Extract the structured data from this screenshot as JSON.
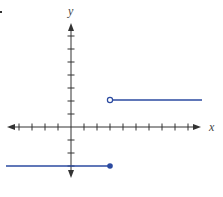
{
  "chart_data": {
    "type": "line",
    "title": "",
    "xlabel": "x",
    "ylabel": "y",
    "xlim": [
      -5,
      9
    ],
    "ylim": [
      -3,
      7
    ],
    "grid": false,
    "tick_spacing": 1,
    "tick_labels": false,
    "series": [
      {
        "name": "piecewise-lower",
        "x": [
          -5,
          3
        ],
        "y": [
          -3,
          -3
        ],
        "left_arrow": false,
        "right_endpoint": "closed",
        "color": "#2b4aa0"
      },
      {
        "name": "piecewise-upper",
        "x": [
          3,
          9.9
        ],
        "y": [
          2,
          2
        ],
        "left_endpoint": "open",
        "color": "#2b4aa0"
      }
    ],
    "function_description": "f(x) = -3 for x <= 3; f(x) = 2 for x > 3"
  },
  "labels": {
    "x_axis": "x",
    "y_axis": "y"
  },
  "colors": {
    "axis": "#333333",
    "graph": "#2b4aa0",
    "marker": "#2b4aa0"
  }
}
